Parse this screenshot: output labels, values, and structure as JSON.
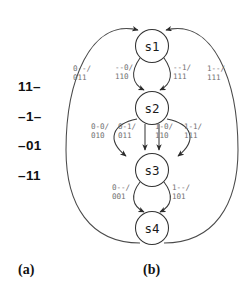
{
  "figure": {
    "panel_a": {
      "caption": "(a)",
      "minterms": [
        {
          "text": "11–"
        },
        {
          "text": "–1–"
        },
        {
          "text": "–01"
        },
        {
          "text": "–11"
        }
      ]
    },
    "panel_b": {
      "caption": "(b)",
      "states": [
        {
          "id": "s1",
          "label": "s1",
          "cx": 92,
          "cy": 46,
          "r": 16.5
        },
        {
          "id": "s2",
          "label": "s2",
          "cx": 92,
          "cy": 108,
          "r": 16.5
        },
        {
          "id": "s3",
          "label": "s3",
          "cx": 92,
          "cy": 170,
          "r": 16.5
        },
        {
          "id": "s4",
          "label": "s4",
          "cx": 92,
          "cy": 228,
          "r": 16.5
        }
      ],
      "transitions": [
        {
          "from": "s1",
          "to": "s2",
          "input": "--0",
          "output": "110",
          "label_line1": "--0/",
          "label_line2": "110",
          "lx": 55,
          "ly": 70
        },
        {
          "from": "s1",
          "to": "s2",
          "input": "--1",
          "output": "111",
          "label_line1": "--1/",
          "label_line2": "111",
          "lx": 113,
          "ly": 70
        },
        {
          "from": "s2",
          "to": "s3",
          "input": "0-0",
          "output": "010",
          "label_line1": "0-0/",
          "label_line2": "010",
          "lx": 31,
          "ly": 129
        },
        {
          "from": "s2",
          "to": "s3",
          "input": "0-1",
          "output": "011",
          "label_line1": "0-1/",
          "label_line2": "011",
          "lx": 58,
          "ly": 129
        },
        {
          "from": "s2",
          "to": "s3",
          "input": "1-0",
          "output": "110",
          "label_line1": "1-0/",
          "label_line2": "110",
          "lx": 95,
          "ly": 129
        },
        {
          "from": "s2",
          "to": "s3",
          "input": "1-1",
          "output": "111",
          "label_line1": "1-1/",
          "label_line2": "111",
          "lx": 124,
          "ly": 129
        },
        {
          "from": "s3",
          "to": "s4",
          "input": "0--",
          "output": "001",
          "label_line1": "0--/",
          "label_line2": "001",
          "lx": 52,
          "ly": 190
        },
        {
          "from": "s3",
          "to": "s4",
          "input": "1--",
          "output": "101",
          "label_line1": "1--/",
          "label_line2": "101",
          "lx": 112,
          "ly": 190
        },
        {
          "from": "s4",
          "to": "s1",
          "input": "0--",
          "output": "011",
          "label_line1": "0--/",
          "label_line2": "011",
          "lx": 13,
          "ly": 71
        },
        {
          "from": "s4",
          "to": "s1",
          "input": "1--",
          "output": "111",
          "label_line1": "1--/",
          "label_line2": "111",
          "lx": 147,
          "ly": 71
        }
      ]
    },
    "colors": {
      "stroke": "#3a3a3a",
      "label": "#6f6f6f",
      "text": "#1a1a1a",
      "background": "#ffffff"
    }
  }
}
